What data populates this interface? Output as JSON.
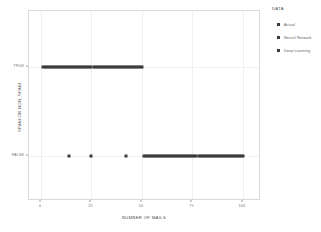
{
  "chart_data": {
    "type": "scatter",
    "title": "",
    "xlabel": "NUMBER OF MAILS",
    "ylabel": "SPAM OR NON_SPAM",
    "xlim": [
      0,
      104
    ],
    "ylim_categories": [
      "FALSE",
      "TRUE"
    ],
    "xticks": [
      0,
      25,
      50,
      75,
      100
    ],
    "xtick_labels": [
      "0",
      "25",
      "50",
      "75",
      "100"
    ],
    "ytick_labels": [
      "TRUE",
      "FALSE"
    ],
    "grid": true,
    "legend": {
      "title": "DATA",
      "position": "right",
      "entries": [
        {
          "label": "Actual",
          "color": "#3a3a3a",
          "marker": "square"
        },
        {
          "label": "Neural Network",
          "color": "#3a3a3a",
          "marker": "square"
        },
        {
          "label": "Deep Learning",
          "color": "#3a3a3a",
          "marker": "square"
        }
      ]
    },
    "marker_color": "#3a3a3a",
    "series": [
      {
        "name": "Actual",
        "points_true_x": [
          1,
          2,
          3,
          4,
          5,
          6,
          7,
          8,
          9,
          10,
          11,
          12,
          13,
          14,
          15,
          16,
          17,
          18,
          19,
          20,
          21,
          22,
          23,
          24,
          25,
          26,
          27,
          28,
          29,
          30,
          31,
          32,
          33,
          34,
          35,
          36,
          37,
          38,
          39,
          40,
          41,
          42,
          43,
          44,
          45,
          46,
          47,
          48,
          49,
          50
        ],
        "points_false_x": [
          14,
          25,
          42,
          51,
          52,
          53,
          54,
          55,
          56,
          57,
          58,
          59,
          60,
          61,
          62,
          63,
          64,
          65,
          66,
          67,
          68,
          69,
          70,
          71,
          72,
          73,
          74,
          75,
          76,
          77,
          78,
          79,
          80,
          81,
          82,
          83,
          84,
          85,
          86,
          87,
          88,
          89,
          90,
          91,
          92,
          93,
          94,
          95,
          96,
          97,
          98,
          99,
          100
        ]
      }
    ]
  },
  "axes": {
    "y_label": "SPAM OR NON_SPAM",
    "x_label": "NUMBER OF MAILS",
    "y_ticks": [
      {
        "label": "TRUE",
        "value": 1
      },
      {
        "label": "FALSE",
        "value": 0
      }
    ],
    "x_ticks": [
      {
        "label": "0",
        "value": 0
      },
      {
        "label": "25",
        "value": 25
      },
      {
        "label": "50",
        "value": 50
      },
      {
        "label": "75",
        "value": 75
      },
      {
        "label": "100",
        "value": 100
      }
    ]
  },
  "legend": {
    "title": "DATA",
    "items": [
      {
        "label": "Actual"
      },
      {
        "label": "Neural Network"
      },
      {
        "label": "Deep Learning"
      }
    ]
  }
}
